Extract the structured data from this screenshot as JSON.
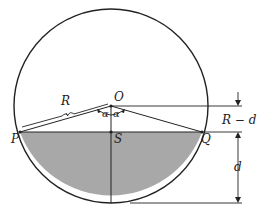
{
  "diagram": {
    "type": "circular-segment",
    "labels": {
      "center": "O",
      "left_point": "P",
      "right_point": "Q",
      "chord_mid": "S",
      "radius": "R",
      "angle_left": "α",
      "angle_right": "α",
      "upper_dim": "R − d",
      "lower_dim": "d"
    },
    "colors": {
      "stroke": "#222222",
      "shaded": "#a8a8a8",
      "background": "#ffffff"
    }
  }
}
